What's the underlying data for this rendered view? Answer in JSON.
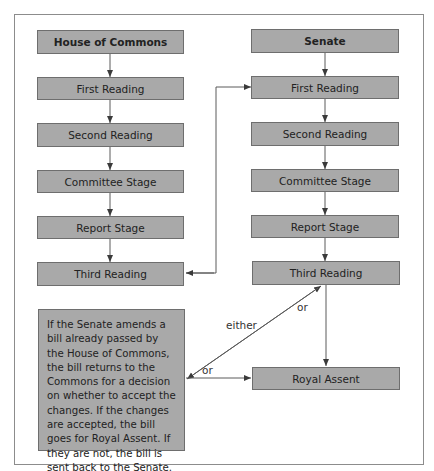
{
  "diagram": {
    "type": "flowchart",
    "title_cropped": true,
    "columns": {
      "commons": {
        "header": "House of Commons",
        "steps": [
          "First Reading",
          "Second Reading",
          "Committee Stage",
          "Report Stage",
          "Third Reading"
        ]
      },
      "senate": {
        "header": "Senate",
        "steps": [
          "First Reading",
          "Second Reading",
          "Committee Stage",
          "Report Stage",
          "Third Reading"
        ]
      }
    },
    "royal_assent": "Royal Assent",
    "note": "If the Senate amends a bill already passed by the House of Commons, the bill returns to the Commons for a decision on whether to accept the changes. If the changes are accepted, the bill goes for Royal Assent. If they are not, the bill is sent back to the Senate.",
    "labels": {
      "either": "either",
      "or_upper": "or",
      "or_lower": "or"
    },
    "edges": [
      {
        "from": "House of Commons",
        "to": "Commons First Reading"
      },
      {
        "from": "Commons First Reading",
        "to": "Commons Second Reading"
      },
      {
        "from": "Commons Second Reading",
        "to": "Commons Committee Stage"
      },
      {
        "from": "Commons Committee Stage",
        "to": "Commons Report Stage"
      },
      {
        "from": "Commons Report Stage",
        "to": "Commons Third Reading"
      },
      {
        "from": "Commons Third Reading",
        "to": "Senate First Reading",
        "bidirectional": true
      },
      {
        "from": "Senate",
        "to": "Senate First Reading"
      },
      {
        "from": "Senate First Reading",
        "to": "Senate Second Reading"
      },
      {
        "from": "Senate Second Reading",
        "to": "Senate Committee Stage"
      },
      {
        "from": "Senate Committee Stage",
        "to": "Senate Report Stage"
      },
      {
        "from": "Senate Report Stage",
        "to": "Senate Third Reading"
      },
      {
        "from": "Senate Third Reading",
        "to": "Royal Assent",
        "label": "or"
      },
      {
        "from": "Senate Third Reading",
        "to": "Note box",
        "label": "either",
        "bidirectional": true
      },
      {
        "from": "Note box",
        "to": "Royal Assent",
        "label": "or"
      }
    ],
    "colors": {
      "box_fill": "#a9a9a9",
      "box_border": "#6e6e6e",
      "line": "#5a5a5a",
      "frame": "#8c8c8c"
    }
  }
}
